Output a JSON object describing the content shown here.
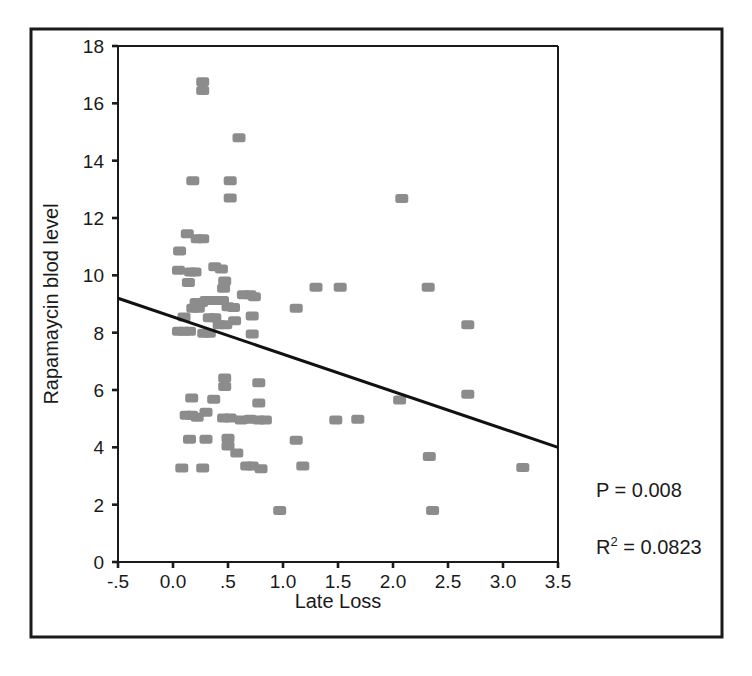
{
  "figure": {
    "background_color": "#ffffff",
    "border_color": "#1a1a1a",
    "marker_color": "#8c8c8c",
    "line_color": "#111111"
  },
  "chart_data": {
    "type": "scatter",
    "title": "",
    "xlabel": "Late Loss",
    "ylabel": "Rapamaycin blod level",
    "xlim": [
      -0.5,
      3.5
    ],
    "ylim": [
      0,
      18
    ],
    "grid": false,
    "legend": "none",
    "xticks": [
      -0.5,
      0.0,
      0.5,
      1.0,
      1.5,
      2.0,
      2.5,
      3.0,
      3.5
    ],
    "xticklabels": [
      "-.5",
      "0.0",
      ".5",
      "1.0",
      "1.5",
      "2.0",
      "2.5",
      "3.0",
      "3.5"
    ],
    "yticks": [
      0,
      2,
      4,
      6,
      8,
      10,
      12,
      14,
      16,
      18
    ],
    "yticklabels": [
      "0",
      "2",
      "4",
      "6",
      "8",
      "10",
      "12",
      "14",
      "16",
      "18"
    ],
    "annotations": [
      {
        "name": "p-value",
        "text": "P = 0.008",
        "x": 3.75,
        "y": 2.0
      },
      {
        "name": "r-squared",
        "text_prefix": "R",
        "text_sup": "2",
        "text_suffix": " = 0.0823",
        "x": 3.75,
        "y": 0.6
      }
    ],
    "trendline": {
      "name": "linear-fit",
      "x": [
        -0.5,
        3.5
      ],
      "y": [
        9.2,
        4.0
      ],
      "slope": -1.3,
      "intercept": 8.55
    },
    "points": [
      [
        0.27,
        16.75
      ],
      [
        0.27,
        16.45
      ],
      [
        0.6,
        14.8
      ],
      [
        0.18,
        13.3
      ],
      [
        0.52,
        13.3
      ],
      [
        0.52,
        12.7
      ],
      [
        2.08,
        12.68
      ],
      [
        0.13,
        11.45
      ],
      [
        0.22,
        11.28
      ],
      [
        0.27,
        11.28
      ],
      [
        0.06,
        10.85
      ],
      [
        0.05,
        10.18
      ],
      [
        0.16,
        10.12
      ],
      [
        0.2,
        10.12
      ],
      [
        0.38,
        10.3
      ],
      [
        0.44,
        10.22
      ],
      [
        0.14,
        9.75
      ],
      [
        0.47,
        9.8
      ],
      [
        0.46,
        9.55
      ],
      [
        0.64,
        9.32
      ],
      [
        0.7,
        9.32
      ],
      [
        0.74,
        9.25
      ],
      [
        1.3,
        9.58
      ],
      [
        1.52,
        9.58
      ],
      [
        2.32,
        9.58
      ],
      [
        0.21,
        9.05
      ],
      [
        0.26,
        9.05
      ],
      [
        0.3,
        9.12
      ],
      [
        0.35,
        9.12
      ],
      [
        0.4,
        9.12
      ],
      [
        0.45,
        9.12
      ],
      [
        0.18,
        8.85
      ],
      [
        0.23,
        8.85
      ],
      [
        0.5,
        8.9
      ],
      [
        0.55,
        8.88
      ],
      [
        1.12,
        8.85
      ],
      [
        0.1,
        8.55
      ],
      [
        0.33,
        8.52
      ],
      [
        0.38,
        8.52
      ],
      [
        0.72,
        8.58
      ],
      [
        0.42,
        8.28
      ],
      [
        0.48,
        8.28
      ],
      [
        0.56,
        8.42
      ],
      [
        2.68,
        8.28
      ],
      [
        0.05,
        8.05
      ],
      [
        0.1,
        8.05
      ],
      [
        0.15,
        8.05
      ],
      [
        0.28,
        7.98
      ],
      [
        0.33,
        7.98
      ],
      [
        0.72,
        7.95
      ],
      [
        0.47,
        6.42
      ],
      [
        0.47,
        6.12
      ],
      [
        0.78,
        6.25
      ],
      [
        0.17,
        5.72
      ],
      [
        0.37,
        5.68
      ],
      [
        0.78,
        5.55
      ],
      [
        2.06,
        5.65
      ],
      [
        2.68,
        5.85
      ],
      [
        0.12,
        5.12
      ],
      [
        0.17,
        5.12
      ],
      [
        0.22,
        5.05
      ],
      [
        0.3,
        5.22
      ],
      [
        0.46,
        5.02
      ],
      [
        0.52,
        5.02
      ],
      [
        0.62,
        4.95
      ],
      [
        0.7,
        4.98
      ],
      [
        0.78,
        4.95
      ],
      [
        0.84,
        4.95
      ],
      [
        1.48,
        4.95
      ],
      [
        1.68,
        4.98
      ],
      [
        0.15,
        4.28
      ],
      [
        0.3,
        4.28
      ],
      [
        0.5,
        4.32
      ],
      [
        0.5,
        4.05
      ],
      [
        1.12,
        4.25
      ],
      [
        0.58,
        3.8
      ],
      [
        2.33,
        3.68
      ],
      [
        0.08,
        3.28
      ],
      [
        0.27,
        3.28
      ],
      [
        0.67,
        3.35
      ],
      [
        0.72,
        3.35
      ],
      [
        0.8,
        3.25
      ],
      [
        1.18,
        3.35
      ],
      [
        3.18,
        3.3
      ],
      [
        0.97,
        1.8
      ],
      [
        2.36,
        1.8
      ]
    ]
  }
}
